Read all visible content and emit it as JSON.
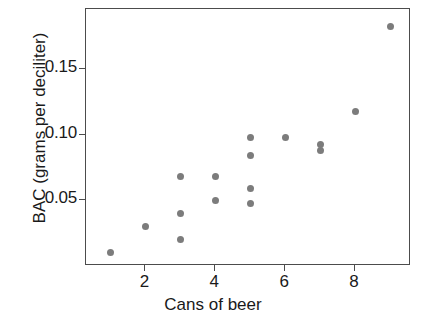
{
  "chart_data": {
    "type": "scatter",
    "title": "",
    "xlabel": "Cans of beer",
    "ylabel": "BAC (grams per deciliter)",
    "xlim": [
      0.3,
      9.6
    ],
    "ylim": [
      0.0,
      0.196
    ],
    "grid": false,
    "legend": null,
    "marker_color": "#7c7c7c",
    "axis_color": "#4c4c4c",
    "xticks": [
      2,
      4,
      6,
      8
    ],
    "xtick_labels": [
      "2",
      "4",
      "6",
      "8"
    ],
    "yticks": [
      0.05,
      0.1,
      0.15
    ],
    "ytick_labels": [
      "0.05",
      "0.10",
      "0.15"
    ],
    "x": [
      1,
      2,
      3,
      3,
      3,
      4,
      4,
      5,
      5,
      5,
      5,
      6,
      7,
      7,
      8,
      9
    ],
    "y": [
      0.01,
      0.03,
      0.02,
      0.04,
      0.068,
      0.05,
      0.068,
      0.048,
      0.059,
      0.084,
      0.098,
      0.098,
      0.088,
      0.093,
      0.118,
      0.183
    ],
    "points": [
      {
        "x": 1,
        "y": 0.01
      },
      {
        "x": 2,
        "y": 0.03
      },
      {
        "x": 3,
        "y": 0.02
      },
      {
        "x": 3,
        "y": 0.04
      },
      {
        "x": 3,
        "y": 0.068
      },
      {
        "x": 4,
        "y": 0.05
      },
      {
        "x": 4,
        "y": 0.068
      },
      {
        "x": 5,
        "y": 0.048
      },
      {
        "x": 5,
        "y": 0.059
      },
      {
        "x": 5,
        "y": 0.084
      },
      {
        "x": 5,
        "y": 0.098
      },
      {
        "x": 6,
        "y": 0.098
      },
      {
        "x": 7,
        "y": 0.088
      },
      {
        "x": 7,
        "y": 0.093
      },
      {
        "x": 8,
        "y": 0.118
      },
      {
        "x": 9,
        "y": 0.183
      }
    ]
  }
}
